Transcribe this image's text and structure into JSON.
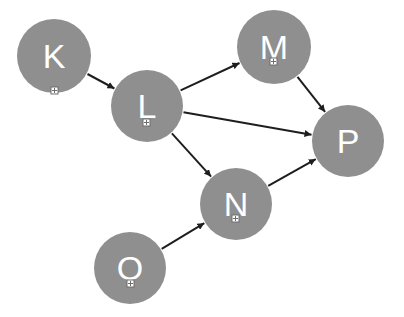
{
  "diagram": {
    "type": "directed-graph",
    "colors": {
      "node_fill": "#8f8f8f",
      "node_text": "#ffffff",
      "edge": "#1e1e1e",
      "background": "#ffffff"
    },
    "nodes": [
      {
        "id": "K",
        "label": "K",
        "cx": 54,
        "cy": 56,
        "r": 37,
        "marker": {
          "x": 51,
          "y": 87
        }
      },
      {
        "id": "L",
        "label": "L",
        "cx": 147,
        "cy": 106,
        "r": 36,
        "marker": {
          "x": 143,
          "y": 119
        }
      },
      {
        "id": "M",
        "label": "M",
        "cx": 274,
        "cy": 47,
        "r": 37,
        "marker": {
          "x": 270,
          "y": 58
        }
      },
      {
        "id": "N",
        "label": "N",
        "cx": 236,
        "cy": 204,
        "r": 36,
        "marker": {
          "x": 232,
          "y": 215
        }
      },
      {
        "id": "O",
        "label": "O",
        "cx": 130,
        "cy": 268,
        "r": 36,
        "marker": {
          "x": 127,
          "y": 280
        }
      },
      {
        "id": "P",
        "label": "P",
        "cx": 348,
        "cy": 141,
        "r": 36,
        "marker": null
      }
    ],
    "edges": [
      {
        "from": "K",
        "to": "L"
      },
      {
        "from": "L",
        "to": "M"
      },
      {
        "from": "L",
        "to": "P"
      },
      {
        "from": "L",
        "to": "N"
      },
      {
        "from": "M",
        "to": "P"
      },
      {
        "from": "N",
        "to": "P"
      },
      {
        "from": "O",
        "to": "N"
      }
    ]
  }
}
